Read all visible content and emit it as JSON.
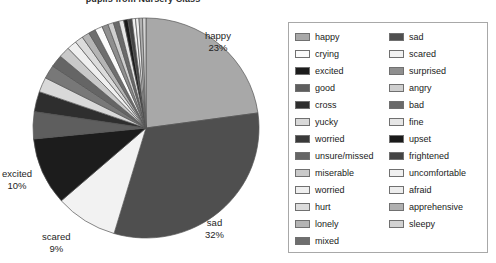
{
  "chart_data": {
    "type": "pie",
    "title": "pupils from Nursery Class",
    "xlabel": "",
    "ylabel": "",
    "legend_position": "right",
    "grid": false,
    "categories": [
      "happy",
      "sad",
      "scared",
      "excited",
      "good",
      "cross",
      "yucky",
      "worried",
      "unsure/missed",
      "miserable",
      "worried",
      "hurt",
      "lonely",
      "mixed",
      "crying",
      "surprised",
      "angry",
      "bad",
      "fine",
      "upset",
      "frightened",
      "uncomfortable",
      "afraid",
      "apprehensive",
      "sleepy"
    ],
    "values": [
      23,
      32,
      9,
      10,
      4,
      3,
      2.2,
      2,
      1.8,
      1.6,
      1.4,
      1.2,
      1.1,
      1,
      1.1,
      0.9,
      0.8,
      0.8,
      0.7,
      0.6,
      0.6,
      0.5,
      0.5,
      0.5,
      0.5
    ],
    "labeled_slices": [
      {
        "label": "happy",
        "percent_text": "23%",
        "percent": 23
      },
      {
        "label": "sad",
        "percent_text": "32%",
        "percent": 32
      },
      {
        "label": "scared",
        "percent_text": "9%",
        "percent": 9
      },
      {
        "label": "excited",
        "percent_text": "10%",
        "percent": 10
      }
    ],
    "slices": [
      {
        "label": "happy",
        "percent": 23,
        "color": "#a8a8a8"
      },
      {
        "label": "sad",
        "percent": 32,
        "color": "#4f4f4f"
      },
      {
        "label": "scared",
        "percent": 9,
        "color": "#f2f2f2"
      },
      {
        "label": "excited",
        "percent": 10,
        "color": "#1c1c1c"
      },
      {
        "label": "good",
        "percent": 4,
        "color": "#5e5e5e"
      },
      {
        "label": "cross",
        "percent": 3,
        "color": "#2e2e2e"
      },
      {
        "label": "yucky",
        "percent": 2.2,
        "color": "#d9d9d9"
      },
      {
        "label": "worried",
        "percent": 2,
        "color": "#787878"
      },
      {
        "label": "unsure/missed",
        "percent": 1.8,
        "color": "#656565"
      },
      {
        "label": "miserable",
        "percent": 1.6,
        "color": "#c9c9c9"
      },
      {
        "label": "worried",
        "percent": 1.4,
        "color": "#efefef"
      },
      {
        "label": "hurt",
        "percent": 1.2,
        "color": "#dcdcdc"
      },
      {
        "label": "lonely",
        "percent": 1.1,
        "color": "#b4b4b4"
      },
      {
        "label": "mixed",
        "percent": 1.0,
        "color": "#6e6e6e"
      },
      {
        "label": "crying",
        "percent": 1.1,
        "color": "#fafafa"
      },
      {
        "label": "surprised",
        "percent": 0.9,
        "color": "#8f8f8f"
      },
      {
        "label": "angry",
        "percent": 0.8,
        "color": "#cfcfcf"
      },
      {
        "label": "bad",
        "percent": 0.8,
        "color": "#6a6a6a"
      },
      {
        "label": "fine",
        "percent": 0.7,
        "color": "#e6e6e6"
      },
      {
        "label": "upset",
        "percent": 0.6,
        "color": "#1a1a1a"
      },
      {
        "label": "frightened",
        "percent": 0.6,
        "color": "#444444"
      },
      {
        "label": "uncomfortable",
        "percent": 0.5,
        "color": "#f0f0f0"
      },
      {
        "label": "afraid",
        "percent": 0.5,
        "color": "#ededed"
      },
      {
        "label": "apprehensive",
        "percent": 0.5,
        "color": "#b0b0b0"
      },
      {
        "label": "sleepy",
        "percent": 0.5,
        "color": "#d2d2d2"
      }
    ]
  },
  "legend": {
    "columns": [
      {
        "items": [
          {
            "label": "happy",
            "color": "#a8a8a8"
          },
          {
            "label": "crying",
            "color": "#fafafa"
          },
          {
            "label": "excited",
            "color": "#1c1c1c"
          },
          {
            "label": "good",
            "color": "#5e5e5e"
          },
          {
            "label": "cross",
            "color": "#2e2e2e"
          },
          {
            "label": "yucky",
            "color": "#d9d9d9"
          },
          {
            "label": "worried",
            "color": "#3a3a3a"
          },
          {
            "label": "unsure/missed",
            "color": "#656565"
          },
          {
            "label": "miserable",
            "color": "#c9c9c9"
          },
          {
            "label": "worried",
            "color": "#efefef"
          },
          {
            "label": "hurt",
            "color": "#dcdcdc"
          },
          {
            "label": "lonely",
            "color": "#b4b4b4"
          },
          {
            "label": "mixed",
            "color": "#6e6e6e"
          }
        ]
      },
      {
        "items": [
          {
            "label": "sad",
            "color": "#4f4f4f"
          },
          {
            "label": "scared",
            "color": "#f2f2f2"
          },
          {
            "label": "surprised",
            "color": "#8f8f8f"
          },
          {
            "label": "angry",
            "color": "#cfcfcf"
          },
          {
            "label": "bad",
            "color": "#6a6a6a"
          },
          {
            "label": "fine",
            "color": "#e6e6e6"
          },
          {
            "label": "upset",
            "color": "#1a1a1a"
          },
          {
            "label": "frightened",
            "color": "#444444"
          },
          {
            "label": "uncomfortable",
            "color": "#f0f0f0"
          },
          {
            "label": "afraid",
            "color": "#ededed"
          },
          {
            "label": "apprehensive",
            "color": "#b0b0b0"
          },
          {
            "label": "sleepy",
            "color": "#d2d2d2"
          }
        ]
      }
    ]
  },
  "colors": {
    "legend_border": "#a8a8a8",
    "slice_outline": "#555555",
    "text": "#1a1a1a",
    "background": "#ffffff"
  }
}
